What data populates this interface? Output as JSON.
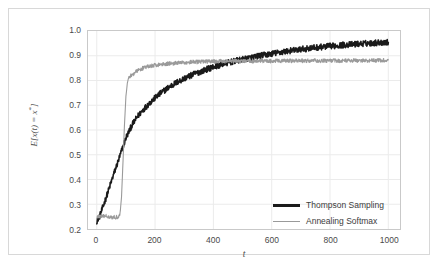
{
  "figure": {
    "background_color": "#ffffff",
    "frame_color": "#d8d8d8",
    "axes_border_color": "#c9c9c9",
    "grid_color": "#ebebeb"
  },
  "axis": {
    "x_title": "t",
    "y_title_prefix": "E[x(t) = x",
    "y_title_superscript": "*",
    "y_title_suffix": "]"
  },
  "chart_data": {
    "type": "line",
    "title": "",
    "xlabel": "t",
    "ylabel": "E[x(t) = x*]",
    "xlim": [
      -30,
      1040
    ],
    "ylim": [
      0.2,
      1.0
    ],
    "xticks": [
      0,
      200,
      400,
      600,
      800,
      1000
    ],
    "xtick_labels": [
      "0",
      "200",
      "400",
      "600",
      "800",
      "1000"
    ],
    "yticks": [
      0.2,
      0.3,
      0.4,
      0.5,
      0.6,
      0.7,
      0.8,
      0.9,
      1.0
    ],
    "ytick_labels": [
      "0.2",
      "0.3",
      "0.4",
      "0.5",
      "0.6",
      "0.7",
      "0.8",
      "0.9",
      "1.0"
    ],
    "grid": true,
    "legend_position": "lower right",
    "series": [
      {
        "name": "Thompson Sampling",
        "color": "#1a1a1a",
        "linewidth": 1.6,
        "noise_amplitude": 0.012,
        "x": [
          0,
          10,
          20,
          30,
          40,
          50,
          60,
          70,
          80,
          90,
          100,
          120,
          140,
          160,
          180,
          200,
          225,
          250,
          275,
          300,
          330,
          360,
          400,
          440,
          480,
          520,
          560,
          600,
          650,
          700,
          750,
          800,
          850,
          900,
          950,
          1000
        ],
        "values": [
          0.232,
          0.252,
          0.285,
          0.32,
          0.355,
          0.392,
          0.428,
          0.462,
          0.497,
          0.533,
          0.568,
          0.618,
          0.655,
          0.683,
          0.708,
          0.73,
          0.754,
          0.775,
          0.793,
          0.808,
          0.824,
          0.838,
          0.855,
          0.869,
          0.88,
          0.89,
          0.9,
          0.908,
          0.918,
          0.926,
          0.933,
          0.939,
          0.944,
          0.948,
          0.952,
          0.955
        ]
      },
      {
        "name": "Annealing Softmax",
        "color": "#9a9a9a",
        "linewidth": 1.1,
        "noise_amplitude": 0.008,
        "x": [
          0,
          10,
          20,
          30,
          40,
          50,
          60,
          70,
          75,
          80,
          85,
          90,
          95,
          100,
          105,
          110,
          120,
          130,
          140,
          160,
          180,
          200,
          240,
          280,
          320,
          360,
          400,
          450,
          500,
          560,
          620,
          700,
          800,
          900,
          1000
        ],
        "values": [
          0.248,
          0.252,
          0.25,
          0.253,
          0.251,
          0.249,
          0.247,
          0.248,
          0.252,
          0.262,
          0.33,
          0.47,
          0.62,
          0.735,
          0.79,
          0.815,
          0.822,
          0.831,
          0.84,
          0.851,
          0.857,
          0.862,
          0.868,
          0.871,
          0.874,
          0.876,
          0.877,
          0.878,
          0.878,
          0.879,
          0.879,
          0.88,
          0.88,
          0.881,
          0.881
        ]
      }
    ]
  },
  "legend": {
    "items": [
      {
        "label": "Thompson Sampling",
        "style": "thick",
        "color": "#1a1a1a"
      },
      {
        "label": "Annealing Softmax",
        "style": "thin",
        "color": "#9a9a9a"
      }
    ]
  }
}
